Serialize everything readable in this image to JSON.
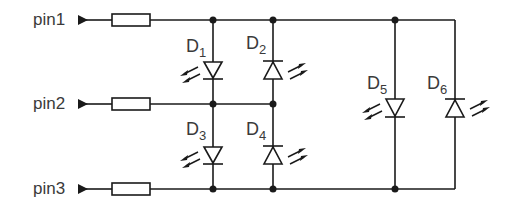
{
  "diagram": {
    "type": "circuit-schematic",
    "pins": [
      {
        "label": "pin1"
      },
      {
        "label": "pin2"
      },
      {
        "label": "pin3"
      }
    ],
    "diodes": [
      {
        "name": "D",
        "index": "1",
        "direction": "down",
        "type": "LED"
      },
      {
        "name": "D",
        "index": "2",
        "direction": "up",
        "type": "LED"
      },
      {
        "name": "D",
        "index": "3",
        "direction": "down",
        "type": "LED"
      },
      {
        "name": "D",
        "index": "4",
        "direction": "up",
        "type": "LED"
      },
      {
        "name": "D",
        "index": "5",
        "direction": "down",
        "type": "LED"
      },
      {
        "name": "D",
        "index": "6",
        "direction": "up",
        "type": "LED"
      }
    ],
    "resistor_count": 3,
    "colors": {
      "line": "#1a1a1a",
      "text": "#3a3a3a"
    }
  }
}
